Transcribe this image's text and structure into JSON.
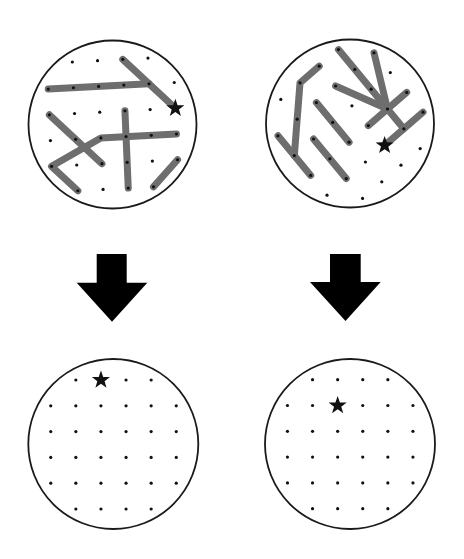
{
  "canvas": {
    "width": 464,
    "height": 559,
    "background": "#ffffff"
  },
  "colors": {
    "circle_stroke": "#1a1a1a",
    "rod": "#6e6e6e",
    "dot": "#111111",
    "star": "#111111",
    "arrow": "#000000"
  },
  "style": {
    "circle_stroke_width": 1.8,
    "rod_width": 7,
    "dot_radius": 1.6,
    "star_outer_radius": 9.5,
    "star_inner_radius": 3.8
  },
  "grid": {
    "size": 6,
    "omit_corners": true
  },
  "panels": [
    {
      "id": "top-left",
      "stage": "before",
      "circle": {
        "cx": 112.5,
        "cy": 124.5,
        "r": 84
      },
      "grid_geometry": {
        "center": [
          112.9,
          124.4
        ],
        "col_vec": [
          25.2,
          -1.32
        ],
        "row_vec": [
          1.1,
          25.75
        ]
      },
      "star": [
        5,
        2
      ],
      "rods": [
        [
          [
            0,
            1
          ],
          [
            4,
            1
          ]
        ],
        [
          [
            3,
            0
          ],
          [
            5,
            2
          ]
        ],
        [
          [
            0,
            2
          ],
          [
            2,
            4
          ]
        ],
        [
          [
            1,
            5
          ],
          [
            0,
            4
          ],
          [
            2,
            3
          ],
          [
            5,
            3
          ]
        ],
        [
          [
            3,
            2
          ],
          [
            3,
            5
          ]
        ],
        [
          [
            4,
            5
          ],
          [
            5,
            4
          ]
        ]
      ]
    },
    {
      "id": "top-right",
      "stage": "before",
      "circle": {
        "cx": 350,
        "cy": 123.5,
        "r": 84
      },
      "grid_geometry": {
        "center": [
          350.5,
          124.0
        ],
        "col_vec": [
          16.35,
          19.8
        ],
        "row_vec": [
          19.2,
          -16.6
        ]
      },
      "star": [
        4,
        3
      ],
      "rods": [
        [
          [
            0,
            3
          ],
          [
            0,
            2
          ],
          [
            2,
            0
          ]
        ],
        [
          [
            1,
            0
          ],
          [
            3,
            0
          ]
        ],
        [
          [
            1,
            2
          ],
          [
            3,
            2
          ]
        ],
        [
          [
            2,
            1
          ],
          [
            4,
            1
          ]
        ],
        [
          [
            0,
            4
          ],
          [
            4,
            4
          ]
        ],
        [
          [
            1,
            5
          ],
          [
            3,
            4
          ]
        ],
        [
          [
            1,
            3
          ],
          [
            3,
            4
          ]
        ],
        [
          [
            3,
            5
          ],
          [
            3,
            3
          ]
        ],
        [
          [
            4,
            5
          ],
          [
            4,
            3
          ]
        ]
      ]
    },
    {
      "id": "bottom-left",
      "stage": "after",
      "circle": {
        "cx": 113.3,
        "cy": 444,
        "r": 85
      },
      "grid_geometry": {
        "center": [
          113.5,
          444.5
        ],
        "col_vec": [
          25.1,
          0
        ],
        "row_vec": [
          0,
          25.8
        ]
      },
      "star": [
        2,
        0
      ],
      "rods": []
    },
    {
      "id": "bottom-right",
      "stage": "after",
      "circle": {
        "cx": 350,
        "cy": 444,
        "r": 85
      },
      "grid_geometry": {
        "center": [
          350.2,
          444.2
        ],
        "col_vec": [
          25.1,
          0
        ],
        "row_vec": [
          0,
          25.8
        ]
      },
      "star": [
        2,
        1
      ],
      "rods": []
    }
  ],
  "arrows": [
    {
      "id": "left-arrow",
      "direction": "down",
      "shaft_left": 96.7,
      "shaft_right": 126.7,
      "shaft_top": 254,
      "head_top": 282.7,
      "head_left": 76.7,
      "head_right": 147.3,
      "tip_x": 112,
      "tip_y": 321.7
    },
    {
      "id": "right-arrow",
      "direction": "down",
      "shaft_left": 330,
      "shaft_right": 360.7,
      "shaft_top": 254,
      "head_top": 282,
      "head_left": 310,
      "head_right": 380.7,
      "tip_x": 345.5,
      "tip_y": 321
    }
  ]
}
